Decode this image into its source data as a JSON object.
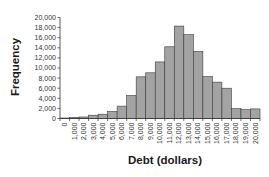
{
  "chart_data": {
    "type": "bar",
    "subtype": "histogram",
    "title": "",
    "xlabel": "Debt (dollars)",
    "ylabel": "Frequency",
    "categories": [
      "0",
      "1,000",
      "2,000",
      "3,000",
      "4,000",
      "5,000",
      "6,000",
      "7,000",
      "8,000",
      "9,000",
      "10,000",
      "11,000",
      "12,000",
      "13,000",
      "14,000",
      "15,000",
      "16,000",
      "17,000",
      "18,000",
      "19,000",
      "20,000"
    ],
    "values": [
      100,
      200,
      300,
      650,
      850,
      1400,
      2450,
      4550,
      8250,
      9050,
      11200,
      14200,
      18300,
      16600,
      13300,
      8300,
      7200,
      6000,
      1950,
      1750,
      1900
    ],
    "yticks": [
      0,
      2000,
      4000,
      6000,
      8000,
      10000,
      12000,
      14000,
      16000,
      18000,
      20000
    ],
    "ytick_labels": [
      "0",
      "2,000",
      "4,000",
      "6,000",
      "8,000",
      "10,000",
      "12,000",
      "14,000",
      "16,000",
      "18,000",
      "20,000"
    ],
    "ylim": [
      0,
      20000
    ],
    "grid": false,
    "legend": null,
    "bar_color": "#a3a3a3",
    "bar_edge_color": "#3a3a3a"
  }
}
